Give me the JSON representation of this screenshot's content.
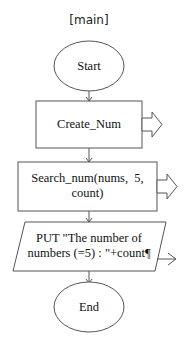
{
  "diagram": {
    "title": "[main]",
    "type": "flowchart",
    "nodes": [
      {
        "id": "start",
        "shape": "ellipse",
        "label": "Start"
      },
      {
        "id": "create_num",
        "shape": "process",
        "label": "Create_Num",
        "has_call_arrow": true
      },
      {
        "id": "search_num",
        "shape": "process",
        "label_line1": "Search_num(nums,  5,",
        "label_line2": "count)",
        "has_call_arrow": true
      },
      {
        "id": "put_output",
        "shape": "parallelogram",
        "label_line1": "PUT \"The number of",
        "label_line2": "numbers (=5) : \"+count¶",
        "has_output_arrow": true
      },
      {
        "id": "end",
        "shape": "ellipse",
        "label": "End"
      }
    ],
    "edges": [
      {
        "from": "start",
        "to": "create_num"
      },
      {
        "from": "create_num",
        "to": "search_num"
      },
      {
        "from": "search_num",
        "to": "put_output"
      },
      {
        "from": "put_output",
        "to": "end"
      }
    ],
    "colors": {
      "stroke": "#555555",
      "text": "#111111",
      "background": "#ffffff"
    }
  }
}
